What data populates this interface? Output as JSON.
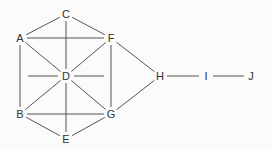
{
  "diagram": {
    "type": "undirected-graph",
    "nodes": [
      {
        "id": "C",
        "label": "C",
        "x": 66,
        "y": 14
      },
      {
        "id": "A",
        "label": "A",
        "x": 20,
        "y": 38
      },
      {
        "id": "F",
        "label": "F",
        "x": 111,
        "y": 38
      },
      {
        "id": "D",
        "label": "D",
        "x": 66,
        "y": 76
      },
      {
        "id": "B",
        "label": "B",
        "x": 20,
        "y": 114
      },
      {
        "id": "G",
        "label": "G",
        "x": 111,
        "y": 114
      },
      {
        "id": "E",
        "label": "E",
        "x": 66,
        "y": 139
      },
      {
        "id": "H",
        "label": "H",
        "x": 160,
        "y": 76
      },
      {
        "id": "I",
        "label": "I",
        "x": 206,
        "y": 76
      },
      {
        "id": "J",
        "label": "J",
        "x": 251,
        "y": 76
      }
    ],
    "edges": [
      [
        "C",
        "A"
      ],
      [
        "C",
        "F"
      ],
      [
        "C",
        "D"
      ],
      [
        "A",
        "F"
      ],
      [
        "A",
        "D"
      ],
      [
        "A",
        "B"
      ],
      [
        "F",
        "D"
      ],
      [
        "F",
        "G"
      ],
      [
        "F",
        "H"
      ],
      [
        "D",
        "B"
      ],
      [
        "D",
        "G"
      ],
      [
        "D",
        "E"
      ],
      [
        "B",
        "G"
      ],
      [
        "B",
        "E"
      ],
      [
        "G",
        "E"
      ],
      [
        "G",
        "H"
      ],
      [
        "H",
        "I"
      ],
      [
        "I",
        "J"
      ]
    ],
    "stubs": [
      {
        "from": "D",
        "x1": 28,
        "y1": 76,
        "x2": 58,
        "y2": 76
      },
      {
        "from": "D",
        "x1": 74,
        "y1": 76,
        "x2": 104,
        "y2": 76
      }
    ]
  }
}
